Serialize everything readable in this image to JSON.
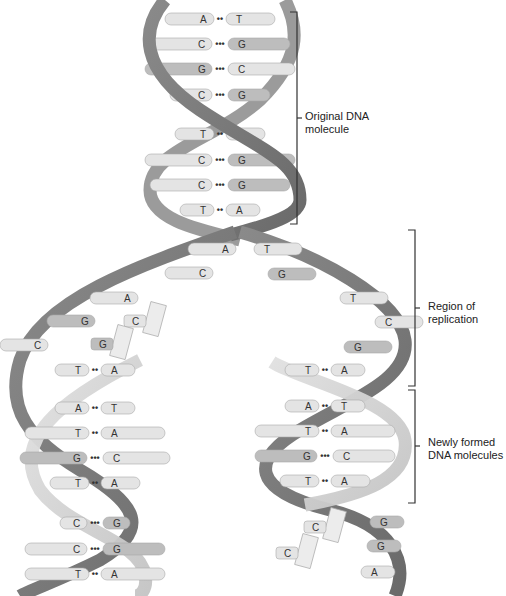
{
  "labels": {
    "original": [
      "Original DNA",
      "molecule"
    ],
    "replication": [
      "Region of",
      "replication"
    ],
    "newly": [
      "Newly formed",
      "DNA molecules"
    ]
  },
  "colors": {
    "strand_dark": "#777777",
    "strand_light": "#cfcfcf",
    "base_dark": "#bdbdbd",
    "base_light": "#e6e6e6",
    "bracket": "#333333"
  },
  "original_pairs": [
    {
      "y": 19,
      "left": "A",
      "right": "T",
      "bonds": "••"
    },
    {
      "y": 44,
      "left": "C",
      "right": "G",
      "bonds": "•••"
    },
    {
      "y": 69,
      "left": "G",
      "right": "C",
      "bonds": "•••"
    },
    {
      "y": 95,
      "left": "C",
      "right": "G",
      "bonds": "•••"
    },
    {
      "y": 134,
      "left": "T",
      "right": "A",
      "bonds": "••"
    },
    {
      "y": 160,
      "left": "C",
      "right": "G",
      "bonds": "•••"
    },
    {
      "y": 185,
      "left": "C",
      "right": "G",
      "bonds": "•••"
    },
    {
      "y": 210,
      "left": "T",
      "right": "A",
      "bonds": "••"
    }
  ],
  "replication_left_bases": [
    {
      "x": 228,
      "y": 249,
      "base": "A"
    },
    {
      "x": 205,
      "y": 273,
      "base": "C"
    },
    {
      "x": 130,
      "y": 298,
      "base": "A"
    },
    {
      "x": 87,
      "y": 321,
      "base": "G"
    },
    {
      "x": 40,
      "y": 345,
      "base": "C"
    }
  ],
  "replication_right_bases": [
    {
      "x": 262,
      "y": 249,
      "base": "T"
    },
    {
      "x": 276,
      "y": 274,
      "base": "G"
    },
    {
      "x": 348,
      "y": 298,
      "base": "T"
    },
    {
      "x": 383,
      "y": 322,
      "base": "C"
    },
    {
      "x": 352,
      "y": 347,
      "base": "G"
    }
  ],
  "free_nucleotides": [
    {
      "x": 138,
      "y": 321,
      "base": "C"
    },
    {
      "x": 105,
      "y": 344,
      "base": "G"
    },
    {
      "x": 318,
      "y": 527,
      "base": "C"
    },
    {
      "x": 290,
      "y": 553,
      "base": "C"
    }
  ],
  "left_new_pairs": [
    {
      "y": 370,
      "left": "T",
      "right": "A",
      "bonds": "••"
    },
    {
      "y": 408,
      "left": "A",
      "right": "T",
      "bonds": "••"
    },
    {
      "y": 433,
      "left": "T",
      "right": "A",
      "bonds": "••"
    },
    {
      "y": 458,
      "left": "G",
      "right": "C",
      "bonds": "•••"
    },
    {
      "y": 483,
      "left": "T",
      "right": "A",
      "bonds": "••"
    },
    {
      "y": 523,
      "left": "C",
      "right": "G",
      "bonds": "•••"
    },
    {
      "y": 549,
      "left": "C",
      "right": "G",
      "bonds": "•••"
    },
    {
      "y": 574,
      "left": "T",
      "right": "A",
      "bonds": "••"
    }
  ],
  "right_new_pairs": [
    {
      "y": 370,
      "left": "T",
      "right": "A",
      "bonds": "••"
    },
    {
      "y": 406,
      "left": "A",
      "right": "T",
      "bonds": "••"
    },
    {
      "y": 431,
      "left": "T",
      "right": "A",
      "bonds": "••"
    },
    {
      "y": 456,
      "left": "G",
      "right": "C",
      "bonds": "•••"
    },
    {
      "y": 481,
      "left": "T",
      "right": "A",
      "bonds": "••"
    }
  ],
  "right_lower_bases": [
    {
      "x": 380,
      "y": 522,
      "base": "G"
    },
    {
      "x": 377,
      "y": 546,
      "base": "G"
    },
    {
      "x": 371,
      "y": 572,
      "base": "A"
    }
  ]
}
